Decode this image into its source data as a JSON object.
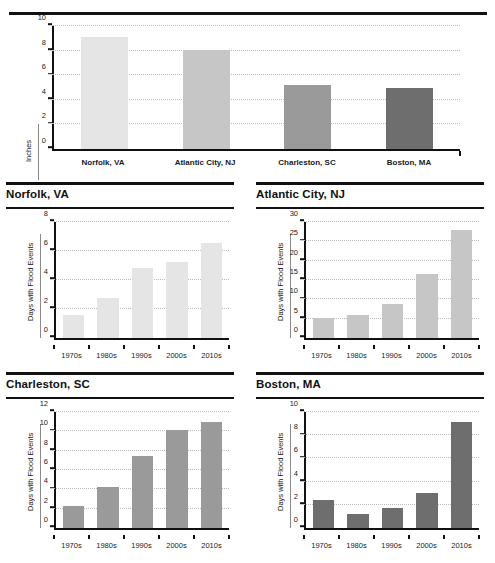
{
  "chart_data": [
    {
      "type": "bar",
      "id": "sea-level-rise",
      "title": "",
      "xlabel": "",
      "ylabel": "Inches",
      "categories": [
        "Norfolk, VA",
        "Atlantic City, NJ",
        "Charleston, SC",
        "Boston, MA"
      ],
      "values": [
        9.1,
        8.05,
        5.1,
        4.85
      ],
      "yticks": [
        0,
        2,
        4,
        6,
        8,
        10
      ],
      "ylim": [
        0,
        10
      ],
      "grid": true,
      "legend": "none",
      "colors": [
        "#e5e5e5",
        "#c6c6c6",
        "#9a9a9a",
        "#6e6e6e"
      ]
    },
    {
      "type": "bar",
      "id": "norfolk",
      "title": "Norfolk, VA",
      "xlabel": "",
      "ylabel": "Days with Flood Events",
      "categories": [
        "1970s",
        "1980s",
        "1990s",
        "2000s",
        "2010s"
      ],
      "values": [
        1.45,
        2.65,
        4.8,
        5.2,
        6.5
      ],
      "yticks": [
        0,
        2,
        4,
        6,
        8
      ],
      "ylim": [
        0,
        8
      ],
      "grid": true,
      "legend": "none",
      "color": "#e5e5e5"
    },
    {
      "type": "bar",
      "id": "atlantic-city",
      "title": "Atlantic City, NJ",
      "xlabel": "",
      "ylabel": "Days with Flood Events",
      "categories": [
        "1970s",
        "1980s",
        "1990s",
        "2000s",
        "2010s"
      ],
      "values": [
        4.8,
        5.4,
        8.3,
        16.2,
        28.0
      ],
      "yticks": [
        0,
        5,
        10,
        15,
        20,
        25,
        30
      ],
      "ylim": [
        0,
        30
      ],
      "grid": true,
      "legend": "none",
      "color": "#c6c6c6"
    },
    {
      "type": "bar",
      "id": "charleston",
      "title": "Charleston, SC",
      "xlabel": "",
      "ylabel": "Days with Flood Events",
      "categories": [
        "1970s",
        "1980s",
        "1990s",
        "2000s",
        "2010s"
      ],
      "values": [
        2.15,
        4.1,
        7.4,
        10.1,
        11.0
      ],
      "yticks": [
        0,
        2,
        4,
        6,
        8,
        10,
        12
      ],
      "ylim": [
        0,
        12
      ],
      "grid": true,
      "legend": "none",
      "color": "#9a9a9a"
    },
    {
      "type": "bar",
      "id": "boston",
      "title": "Boston, MA",
      "xlabel": "",
      "ylabel": "Days with Flood Events",
      "categories": [
        "1970s",
        "1980s",
        "1990s",
        "2000s",
        "2010s"
      ],
      "values": [
        2.3,
        1.05,
        1.55,
        2.9,
        9.1
      ],
      "yticks": [
        0,
        2,
        4,
        6,
        8,
        10
      ],
      "ylim": [
        0,
        10
      ],
      "grid": true,
      "legend": "none",
      "color": "#6e6e6e"
    }
  ]
}
